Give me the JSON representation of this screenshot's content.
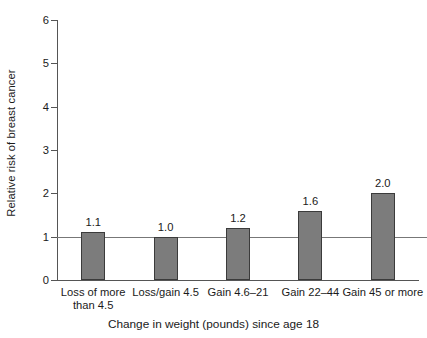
{
  "chart_data": {
    "type": "bar",
    "title": "",
    "xlabel": "Change in weight (pounds) since age 18",
    "ylabel": "Relative risk of breast cancer",
    "categories": [
      "Loss of more\nthan 4.5",
      "Loss/gain 4.5",
      "Gain 4.6–21",
      "Gain 22–44",
      "Gain 45 or more"
    ],
    "values": [
      1.1,
      1.0,
      1.2,
      1.6,
      2.0
    ],
    "value_labels": [
      "1.1",
      "1.0",
      "1.2",
      "1.6",
      "2.0"
    ],
    "ylim": [
      0,
      6
    ],
    "yticks": [
      0,
      1,
      2,
      3,
      4,
      5,
      6
    ],
    "ytick_labels": [
      "0",
      "1",
      "2",
      "3",
      "4",
      "5",
      "6"
    ],
    "grid": false,
    "legend": null,
    "reference_line": 1.0,
    "bar_color": "#7c7c7c",
    "bar_edge_color": "#3b3b3b",
    "axis_color": "#555555",
    "reference_line_color": "#777777",
    "text_color": "#1a1a1a",
    "background_color": "#ffffff"
  }
}
